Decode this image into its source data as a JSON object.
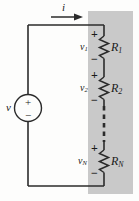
{
  "figure": {
    "type": "circuit-schematic",
    "width": 139,
    "height": 201,
    "background_color": "#fdfdfc",
    "line_color": "#2b2b2b",
    "shaded_region": {
      "name": "equivalent-resistance-region",
      "color": "#c9c9c9",
      "x": 88,
      "y": 11,
      "width": 45,
      "height": 183
    }
  },
  "source": {
    "label": "v",
    "plus_sign": "+",
    "minus_sign": "−",
    "shape": "circle"
  },
  "current": {
    "label": "i",
    "direction": "right",
    "arrow": "→"
  },
  "branches": [
    {
      "voltage_label": "v",
      "voltage_sub": "1",
      "resistor_label": "R",
      "resistor_sub": "1",
      "plus_sign": "+",
      "minus_sign": "−"
    },
    {
      "voltage_label": "v",
      "voltage_sub": "2",
      "resistor_label": "R",
      "resistor_sub": "2",
      "plus_sign": "+",
      "minus_sign": "−"
    },
    {
      "voltage_label": "v",
      "voltage_sub": "N",
      "resistor_label": "R",
      "resistor_sub": "N",
      "plus_sign": "+",
      "minus_sign": "−"
    }
  ],
  "continuation": {
    "style": "dashed-vertical-line",
    "meaning": "additional series resistors"
  }
}
